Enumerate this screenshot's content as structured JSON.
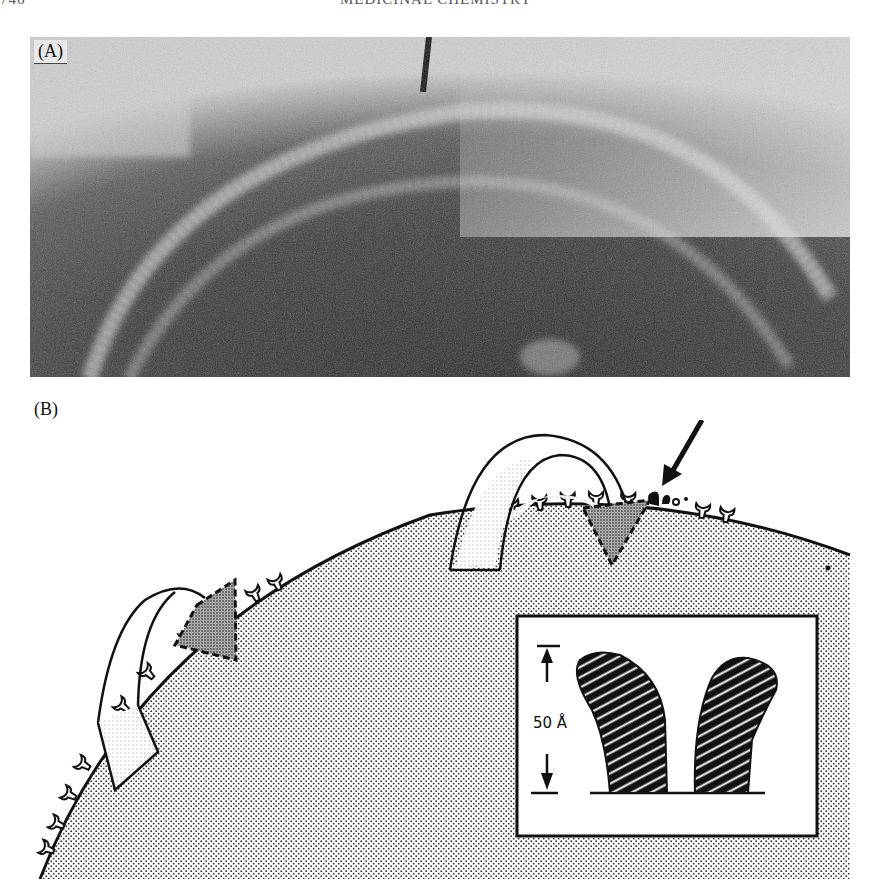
{
  "page": {
    "running_head": {
      "page_number": "746",
      "title": "MEDICINAL CHEMISTRY"
    }
  },
  "figure": {
    "panel_a": {
      "label": "(A)",
      "type": "electron micrograph",
      "description": "Cell surface with concentric bright membrane bands and an arrow marker at top center"
    },
    "panel_b": {
      "label": "(B)",
      "type": "schematic diagram",
      "description": "Stippled cell surface with Y-shaped receptor/antibody-like molecules, two looped ribbon structures with dashed triangular insertion regions, an arrow pointing to a darkened molecule cluster",
      "inset": {
        "scale_label": "50 Å",
        "description": "Enlarged view of two hatched Y-arms over a baseline"
      }
    }
  },
  "colors": {
    "ink": "#111111",
    "paper": "#ffffff",
    "photo_dark": "#3a3a3a",
    "photo_light": "#d8d8d8"
  }
}
